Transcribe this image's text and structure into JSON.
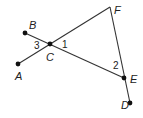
{
  "diagram": {
    "points": [
      {
        "name": "A",
        "x": 18,
        "y": 64,
        "dot": true,
        "label_x": 15,
        "label_y": 80
      },
      {
        "name": "B",
        "x": 25,
        "y": 33,
        "dot": true,
        "label_x": 29,
        "label_y": 29
      },
      {
        "name": "C",
        "x": 50,
        "y": 44,
        "dot": true,
        "label_x": 46,
        "label_y": 61
      },
      {
        "name": "F",
        "x": 110,
        "y": 7,
        "dot": false,
        "label_x": 114,
        "label_y": 14
      },
      {
        "name": "E",
        "x": 124,
        "y": 78,
        "dot": true,
        "label_x": 130,
        "label_y": 83
      },
      {
        "name": "D",
        "x": 130,
        "y": 103,
        "dot": true,
        "label_x": 121,
        "label_y": 109
      }
    ],
    "segments": [
      {
        "from": "A",
        "to": "F"
      },
      {
        "from": "B",
        "to": "E"
      },
      {
        "from": "F",
        "to": "D"
      }
    ],
    "angle_labels": [
      {
        "text": "3",
        "x": 34,
        "y": 49
      },
      {
        "text": "1",
        "x": 62,
        "y": 48
      },
      {
        "text": "2",
        "x": 113,
        "y": 69
      }
    ],
    "line_color": "#333333",
    "dot_color": "#111111"
  }
}
